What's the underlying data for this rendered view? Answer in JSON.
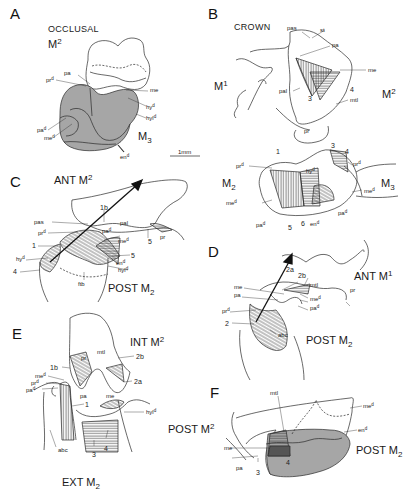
{
  "colors": {
    "line": "#2a2a2a",
    "shade": "#a6a6a6",
    "dark_shade": "#4a4a4a",
    "background": "#ffffff"
  },
  "panels": {
    "A": {
      "letter": "A",
      "view": "OCCLUSAL",
      "upper_tooth": "M",
      "upper_tooth_num": "2",
      "lower_tooth": "M",
      "lower_tooth_num": "3",
      "labels": {
        "pa": "pa",
        "prd": "pr",
        "me": "me",
        "hyd": "hy",
        "hyld": "hyl",
        "pad": "pa",
        "med": "me",
        "end": "en"
      },
      "scale_bar": "1mm"
    },
    "B": {
      "letter": "B",
      "view": "CROWN",
      "teeth": {
        "m1": "M",
        "m1_num": "1",
        "m2_upper": "M",
        "m2_upper_num": "2",
        "m2_lower": "M",
        "m2_lower_num": "2",
        "m3": "M",
        "m3_num": "3"
      },
      "labels": {
        "pas": "pas",
        "st": "st",
        "pa": "pa",
        "me": "me",
        "pal": "pal",
        "mtl": "mtl",
        "pr": "pr",
        "prd_left": "pr",
        "prd_right": "pr",
        "hyd": "hy",
        "med_left": "me",
        "med_right": "me",
        "pad_left": "pa",
        "pad_right": "pa",
        "end": "en"
      },
      "numbers": {
        "n1": "1",
        "n3_upper": "3",
        "n3_lower": "3",
        "n4_upper": "4",
        "n4_lower": "4",
        "n5": "5",
        "n6": "6"
      }
    },
    "C": {
      "letter": "C",
      "ant": "ANT M",
      "ant_num": "2",
      "post": "POST M",
      "post_num": "2",
      "labels": {
        "pas": "pas",
        "prd": "pr",
        "pal": "pal",
        "pad": "pa",
        "med": "me",
        "end": "en",
        "hyld": "hyl",
        "hyd": "hy",
        "pr": "pr",
        "ftb": "ftb"
      },
      "numbers": {
        "n1b": "1b",
        "n1": "1",
        "n5a": "5",
        "n5b": "5",
        "n4": "4"
      }
    },
    "D": {
      "letter": "D",
      "ant": "ANT M",
      "ant_num": "1",
      "post": "POST M",
      "post_num": "2",
      "labels": {
        "me": "me",
        "pa": "pa",
        "prd": "pr",
        "mtl": "mtl",
        "med": "me",
        "pad": "pa",
        "pr": "pr",
        "abc": "abc"
      },
      "numbers": {
        "n2a": "2a",
        "n2b": "2b",
        "n2": "2"
      }
    },
    "E": {
      "letter": "E",
      "int": "INT M",
      "int_num": "2",
      "ext": "EXT M",
      "ext_num": "2",
      "labels": {
        "pr": "pr",
        "mtl": "mtl",
        "med": "me",
        "prd": "pr",
        "pad": "pa",
        "pa": "pa",
        "me": "me",
        "hyld": "hyl",
        "abc": "abc"
      },
      "numbers": {
        "n1b": "1b",
        "n2b": "2b",
        "n2a": "2a",
        "n1": "1",
        "n3": "3",
        "n4": "4"
      }
    },
    "F": {
      "letter": "F",
      "post_upper": "POST M",
      "post_upper_num": "2",
      "post_lower": "POST M",
      "post_lower_num": "2",
      "labels": {
        "mtl": "mtl",
        "med": "me",
        "end": "en",
        "me": "me",
        "pa": "pa"
      },
      "numbers": {
        "n4": "4",
        "n3": "3"
      }
    },
    "superscript_d": "d"
  }
}
